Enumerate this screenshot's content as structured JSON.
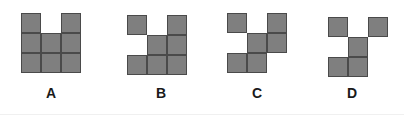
{
  "figures": [
    {
      "label": "A",
      "origin": [
        21,
        13
      ],
      "cells": [
        [
          0,
          0
        ],
        [
          2,
          0
        ],
        [
          0,
          1
        ],
        [
          1,
          1
        ],
        [
          2,
          1
        ],
        [
          0,
          2
        ],
        [
          1,
          2
        ],
        [
          2,
          2
        ]
      ],
      "label_pos": [
        51,
        86
      ]
    },
    {
      "label": "B",
      "origin": [
        127,
        15
      ],
      "cells": [
        [
          0,
          0
        ],
        [
          2,
          0
        ],
        [
          1,
          1
        ],
        [
          2,
          1
        ],
        [
          0,
          2
        ],
        [
          1,
          2
        ],
        [
          2,
          2
        ]
      ],
      "label_pos": [
        161,
        86
      ]
    },
    {
      "label": "C",
      "origin": [
        227,
        13
      ],
      "cells": [
        [
          0,
          0
        ],
        [
          2,
          0
        ],
        [
          1,
          1
        ],
        [
          2,
          1
        ],
        [
          0,
          2
        ],
        [
          1,
          2
        ]
      ],
      "label_pos": [
        257,
        86
      ]
    },
    {
      "label": "D",
      "origin": [
        328,
        17
      ],
      "cells": [
        [
          0,
          0
        ],
        [
          2,
          0
        ],
        [
          1,
          1
        ],
        [
          0,
          2
        ],
        [
          1,
          2
        ]
      ],
      "label_pos": [
        352,
        86
      ]
    }
  ],
  "style": {
    "cell_size": 20,
    "cell_fill": "#7f7f7f",
    "cell_border": "#4a4a4a",
    "label_color": "#1a1a1a"
  }
}
